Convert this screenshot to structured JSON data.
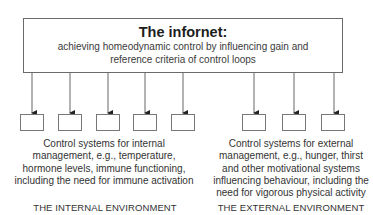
{
  "main": {
    "title": "The infornet:",
    "subtitle_line1": "achieving homeodynamic control by influencing gain and",
    "subtitle_line2": "reference criteria of control loops"
  },
  "internal": {
    "box_count": 5,
    "description_lines": [
      "Control systems for internal",
      "management, e.g., temperature,",
      "hormone levels, immune functioning,",
      "including the need for immune activation"
    ],
    "label": "THE INTERNAL ENVIRONMENT"
  },
  "external": {
    "box_count": 3,
    "description_lines": [
      "Control systems for external",
      "management, e.g., hunger, thirst",
      "and other motivational systems",
      "influencing behaviour, including the",
      "need for vigorous physical activity"
    ],
    "label": "THE EXTERNAL ENVIRONMENT"
  }
}
